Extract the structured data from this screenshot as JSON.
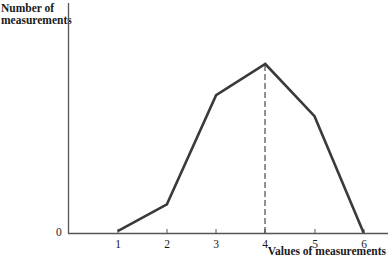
{
  "chart_data": {
    "type": "line",
    "title": "",
    "xlabel": "Values of measurements",
    "ylabel": "Number of\nmeasurements",
    "x": [
      1,
      2,
      3,
      4,
      5,
      6
    ],
    "categories": [
      "1",
      "2",
      "3",
      "4",
      "5",
      "6"
    ],
    "series": [
      {
        "name": "Frequency polygon",
        "values": [
          0.5,
          7.8,
          37.5,
          46,
          31.8,
          0
        ],
        "color": "#3a3a3a"
      }
    ],
    "y_tick_labels": [
      "0"
    ],
    "x_tick_labels": [
      "1",
      "2",
      "3",
      "4",
      "5",
      "6"
    ],
    "ylim": [
      0,
      63
    ],
    "xlim": [
      0,
      6.8
    ],
    "grid": false,
    "legend": null,
    "annotations": [
      {
        "type": "dashed-vertical-line",
        "x": 4,
        "from": 0,
        "to": 46,
        "description": "mode / peak marker"
      }
    ]
  },
  "axes": {
    "y_label": "Number of\nmeasurements",
    "x_label": "Values of measurements",
    "zero_label": "0",
    "ticks": [
      "1",
      "2",
      "3",
      "4",
      "5",
      "6"
    ]
  },
  "colors": {
    "line": "#3a3a3a",
    "axis": "#555555",
    "text": "#1a1a1a"
  }
}
